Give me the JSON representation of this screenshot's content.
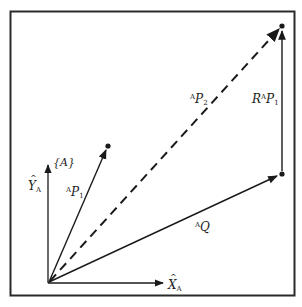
{
  "diagram": {
    "frame_label": "{A}",
    "axes": {
      "x_label": "X",
      "x_sub": "A",
      "y_label": "Y",
      "y_sub": "A"
    },
    "vectors": {
      "p1": {
        "pre": "A",
        "main": "P",
        "sub": "1"
      },
      "p2": {
        "pre": "A",
        "main": "P",
        "sub": "2"
      },
      "q": {
        "pre": "A",
        "main": "Q"
      },
      "rp1": {
        "rot": "R",
        "pre": "A",
        "main": "P",
        "sub": "1"
      }
    },
    "colors": {
      "ink": "#1a1a1a",
      "border": "#2a2a2a",
      "background": "#ffffff"
    }
  }
}
